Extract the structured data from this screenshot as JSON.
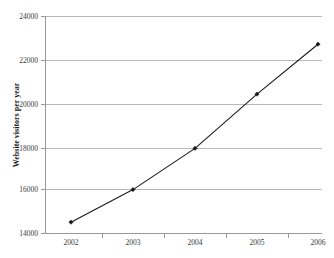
{
  "chart_data": {
    "type": "line",
    "title": "",
    "xlabel": "",
    "ylabel": "Website visitors per year",
    "categories": [
      "2002",
      "2003",
      "2004",
      "2005",
      "2006"
    ],
    "values": [
      14500,
      16000,
      17900,
      20400,
      22700
    ],
    "series": [
      {
        "name": "Website visitors per year",
        "values": [
          14500,
          16000,
          17900,
          20400,
          22700
        ]
      }
    ],
    "ylim": [
      14000,
      24000
    ],
    "ytick_labels": [
      "14000",
      "16000",
      "18000",
      "20000",
      "22000",
      "24000"
    ],
    "ytick_values": [
      14000,
      16000,
      18000,
      20000,
      22000,
      24000
    ],
    "xtick_labels": [
      "2002",
      "2003",
      "2004",
      "2005",
      "2006"
    ],
    "grid": "horizontal",
    "legend": "none",
    "marker": "diamond",
    "line_color": "#1a1a1a",
    "marker_color": "#1a1a1a",
    "grid_color": "#b8b8b8",
    "axis_color": "#9a9a9a",
    "background_color": "#ffffff"
  },
  "axis": {
    "y_title": "Website visitors per year",
    "y_ticks": [
      {
        "label": "24000",
        "value": 24000
      },
      {
        "label": "22000",
        "value": 22000
      },
      {
        "label": "20000",
        "value": 20000
      },
      {
        "label": "18000",
        "value": 18000
      },
      {
        "label": "16000",
        "value": 16000
      },
      {
        "label": "14000",
        "value": 14000
      }
    ],
    "x_ticks": [
      {
        "label": "2002"
      },
      {
        "label": "2003"
      },
      {
        "label": "2004"
      },
      {
        "label": "2005"
      },
      {
        "label": "2006"
      }
    ]
  }
}
